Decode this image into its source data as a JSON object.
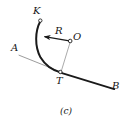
{
  "figure": {
    "caption": "(c)",
    "background_color": "#ffffff",
    "stroke_color": "#141414",
    "thin_stroke_color": "#7a7a7a",
    "labels": {
      "K": "K",
      "R": "R",
      "O": "O",
      "A": "A",
      "T": "T",
      "B": "B"
    },
    "geometry": {
      "arc_start_point": [
        40,
        21
      ],
      "arc_end_point": [
        60,
        72
      ],
      "arc_control_point": [
        35,
        47
      ],
      "tangent_line_from": [
        19,
        55
      ],
      "tangent_line_to": [
        61,
        72
      ],
      "straight_line_from": [
        60,
        72
      ],
      "straight_line_to": [
        114,
        89
      ],
      "center_point": [
        70,
        41
      ],
      "radius_arrow_from": [
        70,
        41
      ],
      "radius_arrow_to": [
        41,
        36
      ],
      "center_to_tangent_from": [
        70,
        42
      ],
      "center_to_tangent_to": [
        61,
        71
      ],
      "marker_points": [
        [
          40,
          21
        ],
        [
          70,
          41
        ],
        [
          60,
          72
        ]
      ]
    }
  }
}
